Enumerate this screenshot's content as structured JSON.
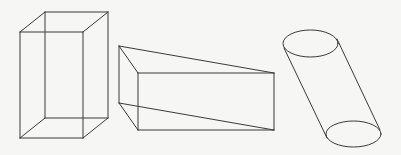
{
  "figure": {
    "background": "#f6f6f4",
    "stroke": "#3a3a3a",
    "shapes": [
      {
        "name": "rectangular-box",
        "type": "cuboid",
        "edges": [
          [
            20,
            32,
            83,
            32
          ],
          [
            83,
            32,
            83,
            138
          ],
          [
            83,
            138,
            20,
            138
          ],
          [
            20,
            138,
            20,
            32
          ],
          [
            45,
            12,
            108,
            12
          ],
          [
            108,
            12,
            108,
            118
          ],
          [
            108,
            118,
            45,
            118
          ],
          [
            45,
            118,
            45,
            12
          ],
          [
            20,
            32,
            45,
            12
          ],
          [
            83,
            32,
            108,
            12
          ],
          [
            83,
            138,
            108,
            118
          ],
          [
            20,
            138,
            45,
            118
          ]
        ]
      },
      {
        "name": "prism",
        "type": "prism",
        "edges": [
          [
            119,
            46,
            274,
            73
          ],
          [
            119,
            46,
            138,
            73
          ],
          [
            138,
            73,
            274,
            73
          ],
          [
            119,
            46,
            119,
            103
          ],
          [
            138,
            73,
            138,
            130
          ],
          [
            274,
            73,
            274,
            130
          ],
          [
            119,
            103,
            138,
            130
          ],
          [
            138,
            130,
            274,
            130
          ],
          [
            119,
            103,
            274,
            130
          ]
        ]
      },
      {
        "name": "oblique-cylinder",
        "type": "cylinder",
        "top_ellipse": {
          "cx": 310.5,
          "cy": 43.5,
          "rx": 27.5,
          "ry": 13.5
        },
        "bottom_ellipse": {
          "cx": 353.5,
          "cy": 134,
          "rx": 27.5,
          "ry": 13
        },
        "edges": [
          [
            284,
            48,
            327,
            138
          ],
          [
            337,
            39,
            380,
            130
          ]
        ]
      }
    ]
  }
}
